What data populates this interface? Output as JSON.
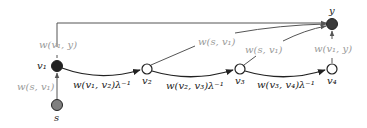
{
  "diagram": {
    "nodes": [
      {
        "id": "v1",
        "label": "v₁",
        "fill": "#222222"
      },
      {
        "id": "s",
        "label": "s",
        "fill": "#808080"
      },
      {
        "id": "v2",
        "label": "v₂",
        "fill": "#ffffff"
      },
      {
        "id": "v3",
        "label": "v₃",
        "fill": "#ffffff"
      },
      {
        "id": "v4",
        "label": "v₄",
        "fill": "#ffffff"
      },
      {
        "id": "y",
        "label": "y",
        "fill": "#3a3a3a"
      }
    ],
    "edge_labels": {
      "v1_y": "w(v₁, y)",
      "s_v1": "w(s, v₁)",
      "v1_v2": "w(v₁, v₂)λ⁻¹",
      "v2_y": "w(s, v₁)",
      "v2_v3": "w(v₂, v₃)λ⁻¹",
      "v3_y": "w(s, v₁)",
      "v3_v4": "w(v₃, v₄)λ⁻¹",
      "v4_y": "w(v₁, y)"
    }
  }
}
